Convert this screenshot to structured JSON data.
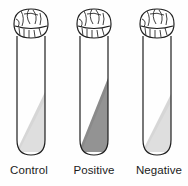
{
  "figure": {
    "name": "test-tube-comparison-diagram",
    "type": "line-drawing",
    "background_color": "#ffffff",
    "outline_color": "#1a1a1a",
    "tube_count": 3
  },
  "tubes": [
    {
      "label": "Control",
      "cap": "gauze-cap",
      "fill_name": "light-gray-liquid",
      "fill_color": "#d6d6d6",
      "fill_shade": "light",
      "fill_level_pct": 72,
      "result": "control"
    },
    {
      "label": "Positive",
      "cap": "gauze-cap",
      "fill_name": "dark-gray-liquid",
      "fill_color": "#8a8a8a",
      "fill_shade": "dark",
      "fill_level_pct": 78,
      "result": "positive"
    },
    {
      "label": "Negative",
      "cap": "gauze-cap",
      "fill_name": "light-gray-liquid",
      "fill_color": "#d6d6d6",
      "fill_shade": "light",
      "fill_level_pct": 70,
      "result": "negative"
    }
  ]
}
